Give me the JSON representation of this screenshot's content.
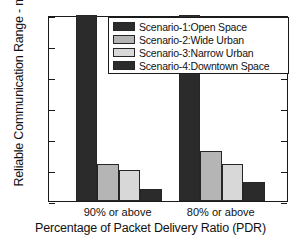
{
  "chart_data": {
    "type": "bar",
    "title": "",
    "xlabel": "Percentage of Packet Delivery Ratio (PDR)",
    "ylabel": "Reliable Communication Range - m",
    "categories": [
      "90% or above",
      "80% or above"
    ],
    "ylim": [
      0,
      300
    ],
    "yticks": [
      0,
      50,
      100,
      150,
      200,
      250,
      300
    ],
    "ytick_labels": [
      "0",
      "50",
      "100",
      "150",
      "200",
      "250",
      "300"
    ],
    "grid": false,
    "legend_position": "top-right",
    "series": [
      {
        "name": "Scenario-1:Open Space",
        "values": [
          300,
          300
        ],
        "color": "#2b2b2b"
      },
      {
        "name": "Scenario-2:Wide Urban",
        "values": [
          60,
          80
        ],
        "color": "#b5b5b5"
      },
      {
        "name": "Scenario-3:Narrow Urban",
        "values": [
          50,
          60
        ],
        "color": "#d8d8d8"
      },
      {
        "name": "Scenario-4:Downtown Space",
        "values": [
          20,
          30
        ],
        "color": "#2b2b2b"
      }
    ]
  }
}
